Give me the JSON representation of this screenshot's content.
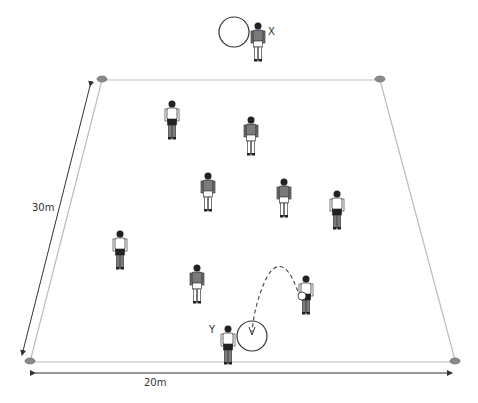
{
  "diagram": {
    "type": "football-drill",
    "pitch": {
      "width_label": "20m",
      "length_label": "30m",
      "line_color": "#bdbdbd",
      "cone_color": "#8a8a8a",
      "corners": [
        {
          "name": "top-left",
          "x": 102,
          "y": 80
        },
        {
          "name": "top-right",
          "x": 380,
          "y": 80
        },
        {
          "name": "bottom-right",
          "x": 455,
          "y": 360
        },
        {
          "name": "bottom-left",
          "x": 30,
          "y": 360
        }
      ]
    },
    "labels": {
      "x": "X",
      "y": "Y"
    },
    "colors": {
      "shirt_dark": "#7a7a7a",
      "shirt_light": "#ffffff",
      "shorts_dark": "#222222",
      "shorts_light": "#ffffff",
      "outline": "#222222",
      "arrow": "#333333"
    },
    "players": [
      {
        "id": "X",
        "team": "dark",
        "x": 258,
        "y": 22,
        "holding": "hoop"
      },
      {
        "id": "p1",
        "team": "light",
        "x": 172,
        "y": 100
      },
      {
        "id": "p2",
        "team": "dark",
        "x": 251,
        "y": 116
      },
      {
        "id": "p3",
        "team": "dark",
        "x": 208,
        "y": 172
      },
      {
        "id": "p4",
        "team": "dark",
        "x": 284,
        "y": 178
      },
      {
        "id": "p5",
        "team": "light",
        "x": 337,
        "y": 190
      },
      {
        "id": "p6",
        "team": "light",
        "x": 120,
        "y": 230
      },
      {
        "id": "p7",
        "team": "dark",
        "x": 197,
        "y": 264
      },
      {
        "id": "p8",
        "team": "light",
        "x": 306,
        "y": 275,
        "holding": "ball"
      },
      {
        "id": "Y",
        "team": "light",
        "x": 228,
        "y": 325,
        "holding": "hoop"
      }
    ],
    "hoops": [
      {
        "name": "hoop-x",
        "cx": 234,
        "cy": 32,
        "r": 15
      },
      {
        "name": "hoop-y",
        "cx": 252,
        "cy": 336,
        "r": 15
      }
    ],
    "pass_path": {
      "from": "p8",
      "to": "hoop-y",
      "style": "dashed"
    }
  }
}
